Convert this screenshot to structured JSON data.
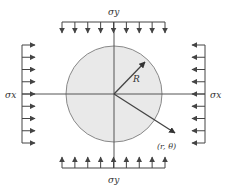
{
  "diagram": {
    "colors": {
      "stroke": "#555555",
      "arrow": "#444444",
      "circle_fill": "#e9e9e9",
      "circle_stroke": "#888888",
      "text": "#333333"
    },
    "labels": {
      "sigma_y_top": "σy",
      "sigma_y_bottom": "σy",
      "sigma_x_left": "σx",
      "sigma_x_right": "σx",
      "radius": "R",
      "point": "(r, θ)"
    },
    "geometry": {
      "center": [
        114,
        94
      ],
      "radius": 48,
      "top_load": {
        "y": 22,
        "x_start": 62,
        "x_end": 165,
        "arrows": 9,
        "direction": "down"
      },
      "bottom_load": {
        "y": 168,
        "x_start": 62,
        "x_end": 165,
        "arrows": 9,
        "direction": "up"
      },
      "left_load": {
        "x": 22,
        "y_start": 45,
        "y_end": 143,
        "arrows": 9,
        "direction": "right"
      },
      "right_load": {
        "x": 205,
        "y_start": 45,
        "y_end": 143,
        "arrows": 9,
        "direction": "left"
      }
    }
  }
}
